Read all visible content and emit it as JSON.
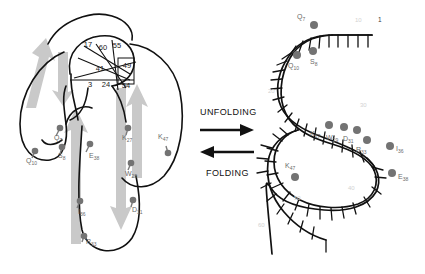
{
  "figure": {
    "left_panel": {
      "name": "folded-protein-structure",
      "contact_numbers": [
        {
          "value": "17",
          "x": 88,
          "y": 47
        },
        {
          "value": "60",
          "x": 103,
          "y": 50
        },
        {
          "value": "55",
          "x": 117,
          "y": 48
        },
        {
          "value": "41",
          "x": 100,
          "y": 71
        },
        {
          "value": "49",
          "x": 127,
          "y": 68
        },
        {
          "value": "3",
          "x": 90,
          "y": 87
        },
        {
          "value": "24",
          "x": 106,
          "y": 87
        },
        {
          "value": "54",
          "x": 126,
          "y": 88
        }
      ],
      "residues": [
        {
          "letter": "Q",
          "number": "7",
          "lx": 54,
          "ly": 140,
          "dx": 60,
          "dy": 128
        },
        {
          "letter": "S",
          "number": "8",
          "lx": 58,
          "ly": 158,
          "dx": 62,
          "dy": 147
        },
        {
          "letter": "Q",
          "number": "10",
          "lx": 28,
          "ly": 163,
          "dx": 35,
          "dy": 151
        },
        {
          "letter": "E",
          "number": "38",
          "lx": 89,
          "ly": 158,
          "dx": 90,
          "dy": 144
        },
        {
          "letter": "K",
          "number": "27",
          "lx": 126,
          "ly": 140,
          "dx": 128,
          "dy": 128
        },
        {
          "letter": "K",
          "number": "47",
          "lx": 162,
          "ly": 139,
          "dx": 168,
          "dy": 153
        },
        {
          "letter": "W",
          "number": "29",
          "lx": 129,
          "ly": 176,
          "dx": 131,
          "dy": 163
        },
        {
          "letter": "I",
          "number": "36",
          "lx": 82,
          "ly": 214,
          "dx": 80,
          "dy": 201
        },
        {
          "letter": "D",
          "number": "31",
          "lx": 136,
          "ly": 212,
          "dx": 133,
          "dy": 200
        },
        {
          "letter": "R",
          "number": "33",
          "lx": 90,
          "ly": 244,
          "dx": 84,
          "dy": 236
        }
      ]
    },
    "center": {
      "unfolding_label": "UNFOLDING",
      "folding_label": "FOLDING"
    },
    "right_panel": {
      "name": "unfolded-extended-chain",
      "terminus_label": "1",
      "tick_numbers": [
        "10",
        "20",
        "30",
        "40",
        "50",
        "60"
      ],
      "residues": [
        {
          "letter": "Q",
          "number": "7",
          "lx": 297,
          "ly": 19,
          "dx": 314,
          "dy": 25
        },
        {
          "letter": "S",
          "number": "8",
          "lx": 315,
          "ly": 61,
          "dx": 313,
          "dy": 51
        },
        {
          "letter": "Q",
          "number": "10",
          "lx": 295,
          "ly": 66,
          "dx": 297,
          "dy": 55
        },
        {
          "letter": "K",
          "number": "27",
          "lx": 317,
          "ly": 132,
          "dx": 329,
          "dy": 125
        },
        {
          "letter": "W",
          "number": "29",
          "lx": 332,
          "ly": 136,
          "dx": 344,
          "dy": 127
        },
        {
          "letter": "D",
          "number": "31",
          "lx": 348,
          "ly": 136,
          "dx": 357,
          "dy": 128
        },
        {
          "letter": "R",
          "number": "33",
          "lx": 360,
          "ly": 147,
          "dx": 364,
          "dy": 138
        },
        {
          "letter": "I",
          "number": "36",
          "lx": 397,
          "ly": 151,
          "dx": 390,
          "dy": 146
        },
        {
          "letter": "K",
          "number": "47",
          "lx": 292,
          "ly": 166,
          "dx": 295,
          "dy": 177
        },
        {
          "letter": "E",
          "number": "38",
          "lx": 399,
          "ly": 179,
          "dx": 392,
          "dy": 173
        }
      ]
    },
    "colors": {
      "backbone": "#111111",
      "residue_dot": "#737373",
      "arrow_gray": "#c9c9c9",
      "label_gray": "#6b6b6b",
      "tick_gray": "#d2d2d2",
      "background": "#ffffff"
    }
  }
}
